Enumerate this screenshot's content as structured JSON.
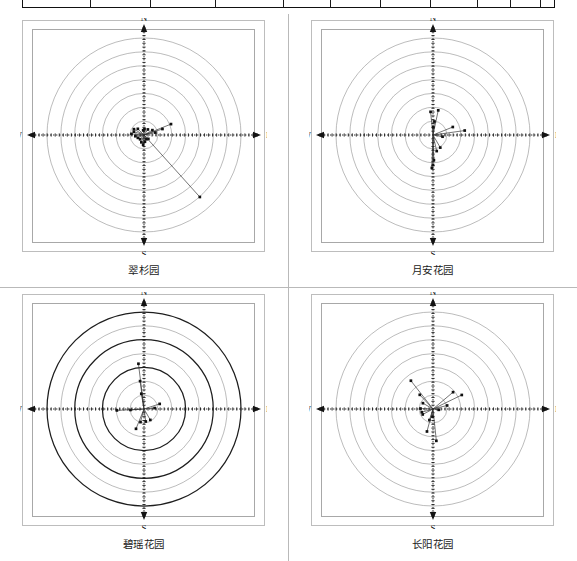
{
  "document": {
    "title": "四个小区风玫瑰极坐标散点图",
    "top_table": {
      "name": "cut-off-table-bottom-edge",
      "column_divider_positions_px": [
        90,
        150,
        215,
        283,
        330,
        380,
        430,
        477,
        510,
        540
      ]
    }
  },
  "panels": [
    {
      "id": "panel-1",
      "caption": "翠杉园",
      "compass": {
        "n": "N",
        "s": "S",
        "e": "E",
        "w": "W"
      },
      "rings": 7,
      "bold_rings": [],
      "chart_data": {
        "type": "scatter",
        "title": "翠杉园",
        "coord": "polar",
        "xlabel": "",
        "ylabel": "",
        "axis_labels": [
          "N",
          "E",
          "S",
          "W"
        ],
        "r_max": 1.0,
        "ring_radii": [
          0.143,
          0.286,
          0.429,
          0.571,
          0.714,
          0.857,
          1.0
        ],
        "points_polar": [
          {
            "theta_deg": 22,
            "r": 0.3
          },
          {
            "theta_deg": 18,
            "r": 0.2
          },
          {
            "theta_deg": 12,
            "r": 0.12
          },
          {
            "theta_deg": 30,
            "r": 0.1
          },
          {
            "theta_deg": 55,
            "r": 0.07
          },
          {
            "theta_deg": 85,
            "r": 0.06
          },
          {
            "theta_deg": 100,
            "r": 0.05
          },
          {
            "theta_deg": 135,
            "r": 0.09
          },
          {
            "theta_deg": 150,
            "r": 0.12
          },
          {
            "theta_deg": 162,
            "r": 0.11
          },
          {
            "theta_deg": 175,
            "r": 0.13
          },
          {
            "theta_deg": 188,
            "r": 0.09
          },
          {
            "theta_deg": 205,
            "r": 0.07
          },
          {
            "theta_deg": 228,
            "r": 0.06
          },
          {
            "theta_deg": 250,
            "r": 0.08
          },
          {
            "theta_deg": 265,
            "r": 0.1
          },
          {
            "theta_deg": 278,
            "r": 0.07
          },
          {
            "theta_deg": 300,
            "r": 0.05
          },
          {
            "theta_deg": 318,
            "r": 0.06
          },
          {
            "theta_deg": 312,
            "r": 0.86
          }
        ]
      }
    },
    {
      "id": "panel-2",
      "caption": "月安花园",
      "compass": {
        "n": "N",
        "s": "S",
        "e": "E",
        "w": "W"
      },
      "rings": 7,
      "bold_rings": [],
      "chart_data": {
        "type": "scatter",
        "title": "月安花园",
        "coord": "polar",
        "xlabel": "",
        "ylabel": "",
        "axis_labels": [
          "N",
          "E",
          "S",
          "W"
        ],
        "r_max": 1.0,
        "ring_radii": [
          0.143,
          0.286,
          0.429,
          0.571,
          0.714,
          0.857,
          1.0
        ],
        "points_polar": [
          {
            "theta_deg": 96,
            "r": 0.24
          },
          {
            "theta_deg": 78,
            "r": 0.26
          },
          {
            "theta_deg": 84,
            "r": 0.14
          },
          {
            "theta_deg": 88,
            "r": 0.08
          },
          {
            "theta_deg": 22,
            "r": 0.22
          },
          {
            "theta_deg": 8,
            "r": 0.33
          },
          {
            "theta_deg": 350,
            "r": 0.1
          },
          {
            "theta_deg": 300,
            "r": 0.15
          },
          {
            "theta_deg": 283,
            "r": 0.17
          },
          {
            "theta_deg": 272,
            "r": 0.26
          },
          {
            "theta_deg": 270,
            "r": 0.31
          },
          {
            "theta_deg": 268,
            "r": 0.34
          }
        ]
      }
    },
    {
      "id": "panel-3",
      "caption": "碧瑶花园",
      "compass": {
        "n": "N",
        "s": "S",
        "e": "E",
        "w": "W"
      },
      "rings": 7,
      "bold_rings": [
        2,
        4,
        6
      ],
      "chart_data": {
        "type": "scatter",
        "title": "碧瑶花园",
        "coord": "polar",
        "xlabel": "",
        "ylabel": "",
        "axis_labels": [
          "N",
          "E",
          "S",
          "W"
        ],
        "r_max": 1.0,
        "ring_radii": [
          0.143,
          0.286,
          0.429,
          0.571,
          0.714,
          0.857,
          1.0
        ],
        "points_polar": [
          {
            "theta_deg": 97,
            "r": 0.47
          },
          {
            "theta_deg": 98,
            "r": 0.29
          },
          {
            "theta_deg": 100,
            "r": 0.16
          },
          {
            "theta_deg": 18,
            "r": 0.17
          },
          {
            "theta_deg": 5,
            "r": 0.11
          },
          {
            "theta_deg": 184,
            "r": 0.14
          },
          {
            "theta_deg": 183,
            "r": 0.28
          },
          {
            "theta_deg": 255,
            "r": 0.14
          },
          {
            "theta_deg": 248,
            "r": 0.22
          },
          {
            "theta_deg": 278,
            "r": 0.13
          },
          {
            "theta_deg": 300,
            "r": 0.13
          }
        ]
      }
    },
    {
      "id": "panel-4",
      "caption": "长阳花园",
      "compass": {
        "n": "N",
        "s": "S",
        "e": "E",
        "w": "W"
      },
      "rings": 7,
      "bold_rings": [],
      "chart_data": {
        "type": "scatter",
        "title": "长阳花园",
        "coord": "polar",
        "xlabel": "",
        "ylabel": "",
        "axis_labels": [
          "N",
          "E",
          "S",
          "W"
        ],
        "r_max": 1.0,
        "ring_radii": [
          0.143,
          0.286,
          0.429,
          0.571,
          0.714,
          0.857,
          1.0
        ],
        "points_polar": [
          {
            "theta_deg": 128,
            "r": 0.37
          },
          {
            "theta_deg": 133,
            "r": 0.2
          },
          {
            "theta_deg": 150,
            "r": 0.12
          },
          {
            "theta_deg": 178,
            "r": 0.13
          },
          {
            "theta_deg": 196,
            "r": 0.12
          },
          {
            "theta_deg": 208,
            "r": 0.12
          },
          {
            "theta_deg": 252,
            "r": 0.12
          },
          {
            "theta_deg": 255,
            "r": 0.24
          },
          {
            "theta_deg": 276,
            "r": 0.33
          },
          {
            "theta_deg": 266,
            "r": 0.08
          },
          {
            "theta_deg": 40,
            "r": 0.27
          },
          {
            "theta_deg": 26,
            "r": 0.33
          },
          {
            "theta_deg": 14,
            "r": 0.15
          },
          {
            "theta_deg": 352,
            "r": 0.06
          }
        ]
      }
    }
  ]
}
